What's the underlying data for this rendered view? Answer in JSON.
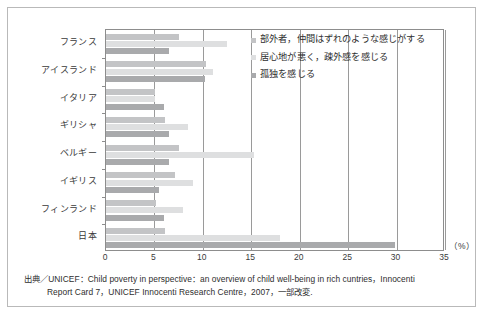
{
  "chart_data": {
    "type": "bar",
    "orientation": "horizontal",
    "title": "",
    "xlabel": "",
    "ylabel": "",
    "unit_label": "（%）",
    "xlim": [
      0,
      35
    ],
    "xticks": [
      0,
      5,
      10,
      15,
      20,
      25,
      30,
      35
    ],
    "xtick_labels": [
      "0",
      "5",
      "10",
      "15",
      "20",
      "25",
      "30",
      "35"
    ],
    "grid": "vertical",
    "legend_position": "inside-top-right",
    "categories": [
      "フランス",
      "アイスランド",
      "イタリア",
      "ギリシャ",
      "ベルギー",
      "イギリス",
      "フィンランド",
      "日本"
    ],
    "series": [
      {
        "name": "部外者，仲間はずれのような感じがする",
        "color": "#c3c4c6",
        "values": [
          7.5,
          10.3,
          5.1,
          6.1,
          7.5,
          7.1,
          5.2,
          6.1
        ]
      },
      {
        "name": "居心地が悪く，疎外感を感じる",
        "color": "#dedfe0",
        "values": [
          12.5,
          11.0,
          5.1,
          8.5,
          15.3,
          9.0,
          8.0,
          18.0
        ]
      },
      {
        "name": "孤独を感じる",
        "color": "#a9aaac",
        "values": [
          6.5,
          10.2,
          6.0,
          6.5,
          6.5,
          5.5,
          6.0,
          29.8
        ]
      }
    ]
  },
  "legend": {
    "items": [
      {
        "label": "部外者，仲間はずれのような感じがする",
        "color": "#c3c4c6"
      },
      {
        "label": "居心地が悪く，疎外感を感じる",
        "color": "#dedfe0"
      },
      {
        "label": "孤独を感じる",
        "color": "#a9aaac"
      }
    ]
  },
  "footnote": {
    "line1": "出典／UNICEF：Child poverty in perspective：an overview of child well-being in rich cuntries，Innocenti",
    "line2": "Report Card 7，UNICEF Innocenti Research Centre，2007，一部改変."
  }
}
